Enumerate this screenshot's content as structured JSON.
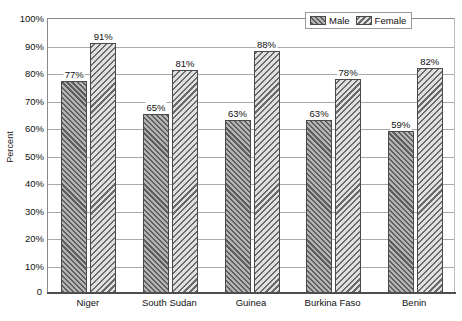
{
  "chart_data": {
    "type": "bar",
    "title": "",
    "xlabel": "",
    "ylabel": "Percent",
    "categories": [
      "Niger",
      "South Sudan",
      "Guinea",
      "Burkina Faso",
      "Benin"
    ],
    "series": [
      {
        "name": "Male",
        "values": [
          77,
          65,
          63,
          63,
          59
        ],
        "labels": [
          "77%",
          "65%",
          "63%",
          "63%",
          "59%"
        ],
        "fill": "#8f8f8f",
        "hatch": "backslash"
      },
      {
        "name": "Female",
        "values": [
          91,
          81,
          88,
          78,
          82
        ],
        "labels": [
          "91%",
          "81%",
          "88%",
          "78%",
          "82%"
        ],
        "fill": "#c4c4c4",
        "hatch": "forwardslash"
      }
    ],
    "ylim": [
      0,
      100
    ],
    "yticks": [
      0,
      10,
      20,
      30,
      40,
      50,
      60,
      70,
      80,
      90,
      100
    ],
    "ytick_labels": [
      "0",
      "10%",
      "20%",
      "30%",
      "40%",
      "50%",
      "60%",
      "70%",
      "80%",
      "90%",
      "100%"
    ],
    "grid": true,
    "legend_position": "top-right",
    "legend_entries": [
      "Male",
      "Female"
    ],
    "colors": {
      "male_fill": "#8f8f8f",
      "female_fill": "#c4c4c4",
      "bar_edge": "#4a4a4a",
      "gridline": "#a9a9a9",
      "axis": "#4d4d4d",
      "text": "#111111",
      "background": "#ffffff"
    }
  }
}
